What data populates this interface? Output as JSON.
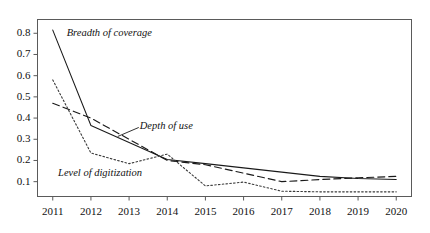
{
  "chart_data": {
    "type": "line",
    "title": "",
    "subtitle": "",
    "xlabel": "",
    "ylabel": "",
    "categories": [
      "2011",
      "2012",
      "2013",
      "2014",
      "2015",
      "2016",
      "2017",
      "2018",
      "2019",
      "2020"
    ],
    "x": [
      2011,
      2012,
      2013,
      2014,
      2015,
      2016,
      2017,
      2018,
      2019,
      2020
    ],
    "xlim": [
      2010.6,
      2020.4
    ],
    "ylim": [
      0.03,
      0.865
    ],
    "yticks": [
      0.1,
      0.2,
      0.3,
      0.4,
      0.5,
      0.6,
      0.7,
      0.8
    ],
    "ytick_labels": [
      "0.1",
      "0.2",
      "0.3",
      "0.4",
      "0.5",
      "0.6",
      "0.7",
      "0.8"
    ],
    "xtick_labels": [
      "2011",
      "2012",
      "2013",
      "2014",
      "2015",
      "2016",
      "2017",
      "2018",
      "2019",
      "2020"
    ],
    "grid": false,
    "legend": "inline-annotations",
    "legend_position": "inline",
    "frame": "box",
    "series": [
      {
        "name": "Breadth of coverage",
        "style": "solid",
        "color": "#1a1a1a",
        "values": [
          0.815,
          0.365,
          0.285,
          0.205,
          0.185,
          0.165,
          0.145,
          0.125,
          0.115,
          0.11
        ]
      },
      {
        "name": "Depth of use",
        "style": "dashed",
        "color": "#1a1a1a",
        "values": [
          0.47,
          0.4,
          0.3,
          0.2,
          0.18,
          0.14,
          0.1,
          0.11,
          0.118,
          0.125
        ]
      },
      {
        "name": "Level of digitization",
        "style": "dotted",
        "color": "#3a3a3a",
        "values": [
          0.58,
          0.235,
          0.185,
          0.23,
          0.08,
          0.098,
          0.055,
          0.052,
          0.052,
          0.052
        ]
      }
    ],
    "annotations": [
      {
        "text": "Breadth of coverage",
        "x": 0.155,
        "y": 0.118,
        "leader": false
      },
      {
        "text": "Depth of use",
        "x": 0.325,
        "y": 0.517,
        "leader": true
      },
      {
        "text": "Level of digitization",
        "x": 0.135,
        "y": 0.715,
        "leader": false
      }
    ]
  }
}
